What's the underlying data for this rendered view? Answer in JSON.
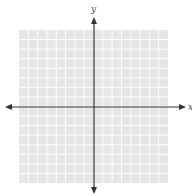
{
  "diagram": {
    "type": "coordinate-plane",
    "x_axis_label": "x",
    "y_axis_label": "y",
    "grid": {
      "columns": 16,
      "rows": 16,
      "background_color": "#e6e6e6",
      "line_color": "#ffffff"
    },
    "axis_color": "#333333"
  }
}
